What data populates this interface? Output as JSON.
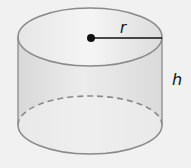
{
  "figure": {
    "type": "cylinder",
    "labels": {
      "radius": "r",
      "height": "h"
    },
    "colors": {
      "background": "#f1f1f1",
      "outline": "#8a8a8a",
      "fill_body": "#e2e2e2",
      "fill_top": "#ebebeb",
      "radius_line": "#111111",
      "center_dot": "#111111"
    }
  }
}
